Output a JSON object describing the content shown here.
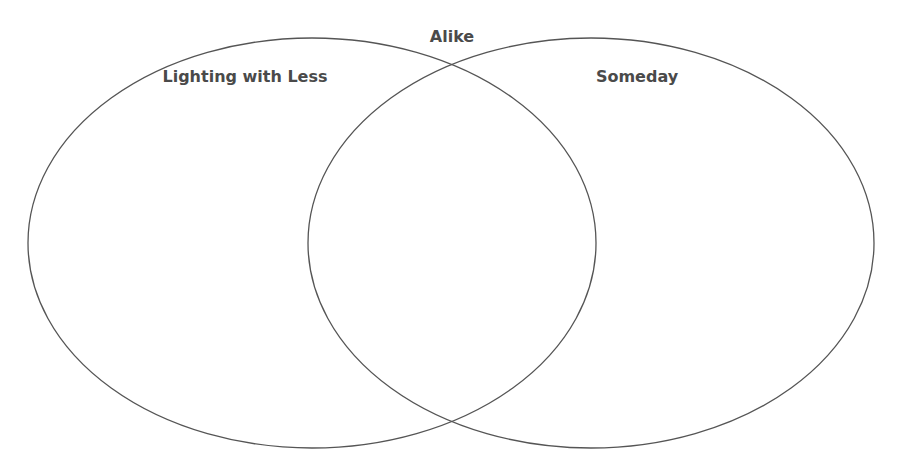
{
  "diagram": {
    "type": "venn",
    "overlap_label": "Alike",
    "sets": [
      {
        "id": "left",
        "label": "Lighting with Less",
        "cx": 312,
        "cy": 243,
        "rx": 284,
        "ry": 205
      },
      {
        "id": "right",
        "label": "Someday",
        "cx": 591,
        "cy": 243,
        "rx": 283,
        "ry": 205
      }
    ],
    "stroke_color": "#555555",
    "label_color": "#4a4a4a",
    "background": "#ffffff"
  }
}
